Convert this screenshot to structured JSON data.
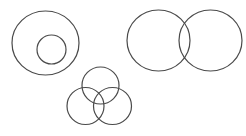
{
  "canvas": {
    "width": 246,
    "height": 136,
    "background": "#ffffff"
  },
  "style": {
    "stroke": "#4a4a4a"
  },
  "diagrams": [
    {
      "name": "nested-circles",
      "type": "euler-subset",
      "circles": [
        {
          "name": "outer-circle",
          "cx": 45.5,
          "cy": 43,
          "rx": 33.5,
          "ry": 32
        },
        {
          "name": "inner-circle",
          "cx": 51.5,
          "cy": 49.5,
          "rx": 14.5,
          "ry": 14.5
        }
      ]
    },
    {
      "name": "two-set-venn",
      "type": "venn-2",
      "circles": [
        {
          "name": "left-circle",
          "cx": 158.5,
          "cy": 40.5,
          "rx": 31.5,
          "ry": 30.5
        },
        {
          "name": "right-circle",
          "cx": 210.5,
          "cy": 40.5,
          "rx": 31.5,
          "ry": 30.5
        }
      ]
    },
    {
      "name": "three-set-venn",
      "type": "venn-3",
      "circles": [
        {
          "name": "top-circle",
          "cx": 100.5,
          "cy": 85.5,
          "rx": 18.5,
          "ry": 18.5
        },
        {
          "name": "bottom-left-circle",
          "cx": 85.5,
          "cy": 106,
          "rx": 18.5,
          "ry": 18.5
        },
        {
          "name": "bottom-right-circle",
          "cx": 112.5,
          "cy": 106,
          "rx": 19,
          "ry": 18.5
        }
      ]
    }
  ]
}
